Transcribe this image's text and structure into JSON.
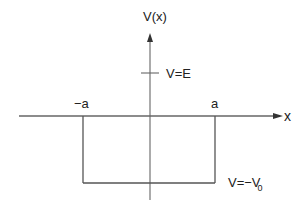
{
  "diagram": {
    "type": "finite-square-well-potential",
    "y_axis_label": "V(x)",
    "x_axis_label": "x",
    "energy_level_label": "V=E",
    "left_edge_label": "−a",
    "right_edge_label": "a",
    "well_depth_label": "V=−V",
    "well_depth_subscript": "0",
    "colors": {
      "line": "#555555",
      "text": "#222222",
      "background": "#ffffff"
    }
  }
}
